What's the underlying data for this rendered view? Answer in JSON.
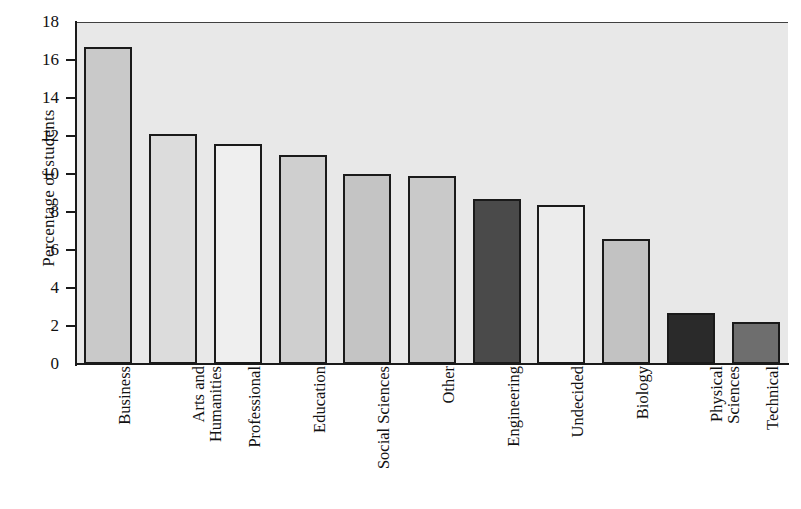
{
  "chart_data": {
    "type": "bar",
    "title": "",
    "xlabel": "",
    "ylabel": "Percentage of students",
    "ylim": [
      0,
      18
    ],
    "ytick_labels": [
      "0",
      "2",
      "4",
      "6",
      "8",
      "10",
      "12",
      "14",
      "16",
      "18"
    ],
    "ytick_values": [
      0,
      2,
      4,
      6,
      8,
      10,
      12,
      14,
      16,
      18
    ],
    "grid": false,
    "legend": "none",
    "plot_background": "#e8e8e8",
    "categories": [
      "Business",
      "Arts and\nHumanities",
      "Professional",
      "Education",
      "Social Sciences",
      "Other",
      "Engineering",
      "Undecided",
      "Biology",
      "Physical\nSciences",
      "Technical"
    ],
    "values": [
      16.7,
      12.1,
      11.6,
      11.0,
      10.0,
      9.9,
      8.7,
      8.35,
      6.6,
      2.7,
      2.2
    ],
    "bar_colors": [
      "#c9c9c9",
      "#dcdcdc",
      "#efefef",
      "#cfcfcf",
      "#c4c4c4",
      "#c9c9c9",
      "#4a4a4a",
      "#ececec",
      "#c2c2c2",
      "#2a2a2a",
      "#6e6e6e"
    ],
    "bar_edge_color": "#1a1a1a"
  },
  "axis": {
    "y_title": "Percentage of students"
  }
}
